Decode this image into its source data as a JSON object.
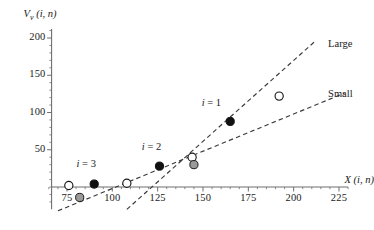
{
  "chart_data": {
    "type": "scatter",
    "title": "",
    "xlabel": "X (i, n)",
    "ylabel": "V_v (i, n)",
    "xlabel_parts": {
      "var": "X",
      "sub": "",
      "args": "(i, n)"
    },
    "ylabel_parts": {
      "var": "V",
      "sub": "v",
      "args": "(i, n)"
    },
    "xlim": [
      62,
      232
    ],
    "ylim": [
      -35,
      215
    ],
    "grid": false,
    "legend_position": "inline-right",
    "xticks": [
      75,
      100,
      125,
      150,
      175,
      200,
      225
    ],
    "xtick_labels": [
      "75",
      "100",
      "125",
      "150",
      "175",
      "200",
      "225"
    ],
    "yticks": [
      50,
      100,
      150,
      200
    ],
    "ytick_labels": [
      "50",
      "100",
      "150",
      "200"
    ],
    "x_minor_step": 5,
    "y_minor_step": 10,
    "series": [
      {
        "name": "Large",
        "label": "Large",
        "style": "dashed",
        "color": "#3a3a3a",
        "line_x": [
          108,
          212
        ],
        "line_y": [
          -30,
          196
        ],
        "label_x": 219,
        "label_y": 190
      },
      {
        "name": "Small",
        "label": "Small",
        "style": "dashed",
        "color": "#3a3a3a",
        "line_x": [
          70,
          228
        ],
        "line_y": [
          -32,
          126
        ],
        "label_x": 219,
        "label_y": 123
      }
    ],
    "markers": [
      {
        "id": "open-1",
        "x": 76,
        "y": 2,
        "fill": "open"
      },
      {
        "id": "gray-1",
        "x": 82,
        "y": -14,
        "fill": "gray"
      },
      {
        "id": "black-3",
        "x": 90,
        "y": 4,
        "fill": "black",
        "label": "i = 3"
      },
      {
        "id": "open-2",
        "x": 108,
        "y": 5,
        "fill": "open"
      },
      {
        "id": "black-2",
        "x": 126,
        "y": 28,
        "fill": "black",
        "label": "i = 2"
      },
      {
        "id": "open-3",
        "x": 144,
        "y": 40,
        "fill": "open"
      },
      {
        "id": "gray-2",
        "x": 145,
        "y": 30,
        "fill": "gray"
      },
      {
        "id": "black-1",
        "x": 165,
        "y": 88,
        "fill": "black",
        "label": "i = 1"
      },
      {
        "id": "open-4",
        "x": 192,
        "y": 122,
        "fill": "open"
      }
    ],
    "point_labels": [
      {
        "text": "i = 3",
        "var": "i",
        "eq": " = 3",
        "x": 88,
        "y": 30
      },
      {
        "text": "i = 2",
        "var": "i",
        "eq": " = 2",
        "x": 124,
        "y": 52
      },
      {
        "text": "i = 1",
        "var": "i",
        "eq": " = 1",
        "x": 157,
        "y": 112
      }
    ],
    "colors": {
      "axis": "#6e6e6e",
      "line": "#3a3a3a",
      "marker_black": "#111111",
      "marker_gray": "#9a9a9a",
      "marker_open": "#ffffff",
      "marker_edge": "#1a1a1a",
      "text": "#1a1a1a",
      "background": "#ffffff"
    }
  }
}
